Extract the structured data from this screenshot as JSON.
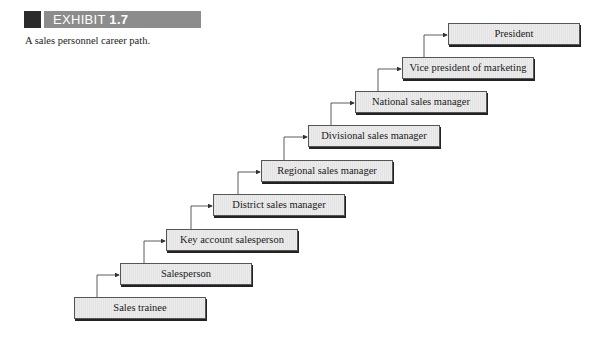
{
  "exhibit": {
    "label_prefix": "EXHIBIT",
    "label_number": "1.7",
    "caption": "A sales personnel career path."
  },
  "colors": {
    "exhibit_square": "#2b2b2b",
    "exhibit_bar": "#8c8c8c",
    "box_fill": "#ececec",
    "box_border": "#555555",
    "connector": "#333333"
  },
  "career_path": {
    "direction": "bottom-left to top-right",
    "steps": [
      {
        "level": 1,
        "label": "Sales trainee"
      },
      {
        "level": 2,
        "label": "Salesperson"
      },
      {
        "level": 3,
        "label": "Key account salesperson"
      },
      {
        "level": 4,
        "label": "District sales manager"
      },
      {
        "level": 5,
        "label": "Regional sales manager"
      },
      {
        "level": 6,
        "label": "Divisional sales manager"
      },
      {
        "level": 7,
        "label": "National sales manager"
      },
      {
        "level": 8,
        "label": "Vice president of marketing"
      },
      {
        "level": 9,
        "label": "President"
      }
    ]
  }
}
